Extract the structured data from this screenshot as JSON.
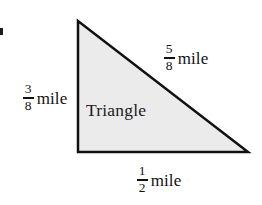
{
  "figure": {
    "kind": "geometry-diagram",
    "shape_name": "Triangle",
    "interior_label": "Triangle",
    "fill_color": "#ebebeb",
    "stroke_color": "#111111",
    "background_color": "#ffffff",
    "stroke_width": 2.5,
    "vertices": {
      "apex": [
        78,
        21
      ],
      "bottom_left": [
        78,
        152
      ],
      "bottom_right": [
        248,
        152
      ]
    },
    "svg_points": "78,21 78,152 248,152"
  },
  "labels": {
    "hypotenuse": {
      "numerator": "5",
      "denominator": "8",
      "unit": "mile",
      "side": "hypotenuse"
    },
    "left_side": {
      "numerator": "3",
      "denominator": "8",
      "unit": "mile",
      "side": "height"
    },
    "base": {
      "numerator": "1",
      "denominator": "2",
      "unit": "mile",
      "side": "base"
    }
  }
}
